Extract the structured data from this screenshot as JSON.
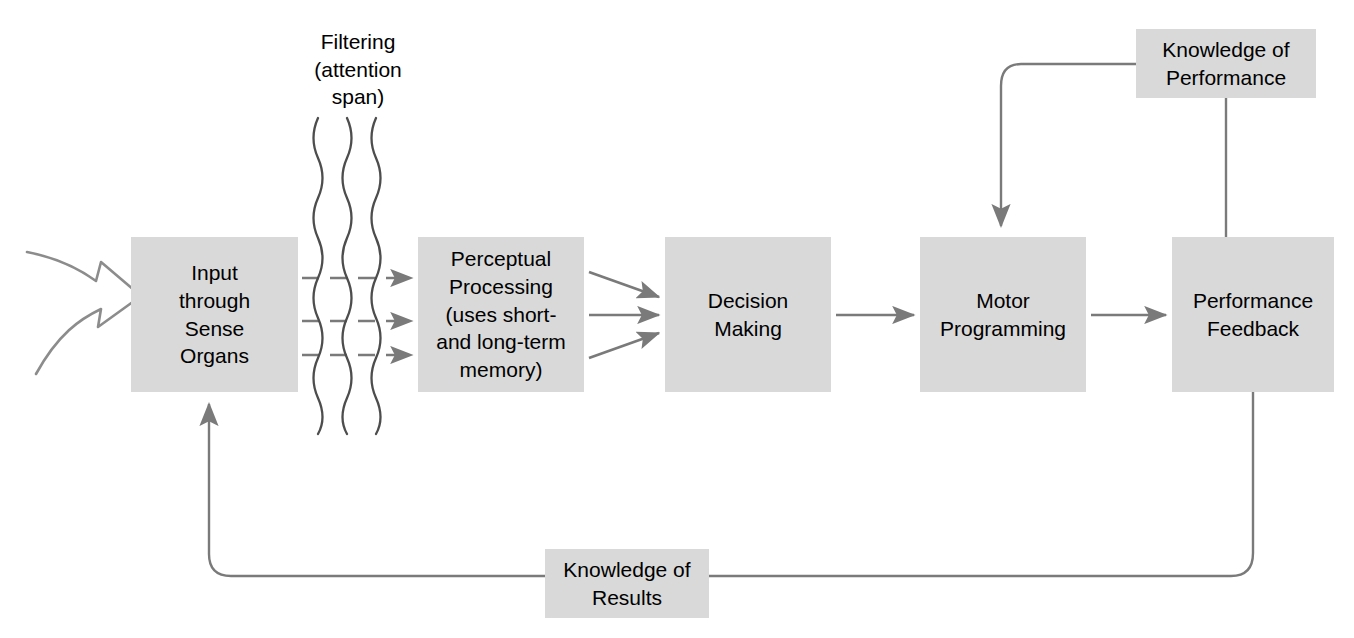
{
  "diagram": {
    "type": "flow-diagram",
    "background_color": "#ffffff",
    "box_fill_color": "#d9d9d9",
    "line_color": "#7a7a7a",
    "text_color": "#000000",
    "nodes": [
      {
        "id": "input-sense-organs",
        "label": "Input\nthrough\nSense\nOrgans",
        "x": 131,
        "y": 237,
        "w": 167,
        "h": 155
      },
      {
        "id": "perceptual-processing",
        "label": "Perceptual\nProcessing\n(uses short-\nand long-term\nmemory)",
        "x": 418,
        "y": 237,
        "w": 166,
        "h": 155
      },
      {
        "id": "decision-making",
        "label": "Decision\nMaking",
        "x": 665,
        "y": 237,
        "w": 166,
        "h": 155
      },
      {
        "id": "motor-programming",
        "label": "Motor\nProgramming",
        "x": 920,
        "y": 237,
        "w": 166,
        "h": 155
      },
      {
        "id": "performance-feedback",
        "label": "Performance\nFeedback",
        "x": 1172,
        "y": 237,
        "w": 162,
        "h": 155
      },
      {
        "id": "knowledge-of-performance",
        "label": "Knowledge of\nPerformance",
        "x": 1136,
        "y": 29,
        "w": 180,
        "h": 69
      },
      {
        "id": "knowledge-of-results",
        "label": "Knowledge of\nResults",
        "x": 545,
        "y": 549,
        "w": 164,
        "h": 69
      }
    ],
    "free_labels": [
      {
        "id": "filtering-attention-span",
        "label": "Filtering\n(attention\nspan)",
        "x": 283,
        "y": 28,
        "w": 150
      }
    ],
    "connectors": [
      {
        "id": "external-input-arrow",
        "from": "world",
        "to": "input-sense-organs",
        "style": "hollow-double-tail-arrow"
      },
      {
        "id": "input-to-perceptual-1",
        "from": "input-sense-organs",
        "to": "perceptual-processing",
        "style": "dashed-arrow"
      },
      {
        "id": "input-to-perceptual-2",
        "from": "input-sense-organs",
        "to": "perceptual-processing",
        "style": "dashed-arrow"
      },
      {
        "id": "input-to-perceptual-3",
        "from": "input-sense-organs",
        "to": "perceptual-processing",
        "style": "dashed-arrow"
      },
      {
        "id": "perceptual-to-decision-1",
        "from": "perceptual-processing",
        "to": "decision-making",
        "style": "arrow"
      },
      {
        "id": "perceptual-to-decision-2",
        "from": "perceptual-processing",
        "to": "decision-making",
        "style": "arrow"
      },
      {
        "id": "perceptual-to-decision-3",
        "from": "perceptual-processing",
        "to": "decision-making",
        "style": "arrow"
      },
      {
        "id": "decision-to-motor",
        "from": "decision-making",
        "to": "motor-programming",
        "style": "arrow"
      },
      {
        "id": "motor-to-performance",
        "from": "motor-programming",
        "to": "performance-feedback",
        "style": "arrow"
      },
      {
        "id": "performance-to-kop",
        "from": "performance-feedback",
        "to": "knowledge-of-performance",
        "style": "line"
      },
      {
        "id": "kop-to-motor",
        "from": "knowledge-of-performance",
        "to": "motor-programming",
        "style": "arrow"
      },
      {
        "id": "performance-to-kor",
        "from": "performance-feedback",
        "to": "knowledge-of-results",
        "style": "line"
      },
      {
        "id": "kor-to-input",
        "from": "knowledge-of-results",
        "to": "input-sense-organs",
        "style": "arrow"
      }
    ],
    "filter_waves": {
      "count": 3,
      "x_positions": [
        316,
        345,
        374
      ],
      "top": 118,
      "bottom": 434
    }
  }
}
